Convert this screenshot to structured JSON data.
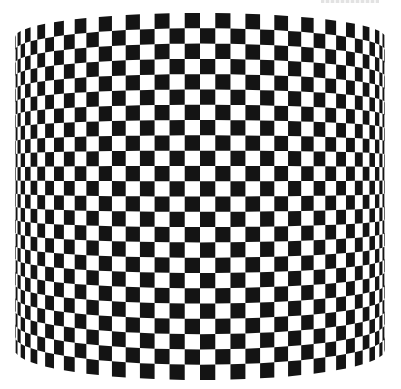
{
  "image": {
    "subject": "Black and white checkerboard pattern wrapped around a cylinder (lampshade-like shape)",
    "background_color": "#ffffff",
    "dark_color": "#141414",
    "light_color": "#ffffff",
    "pattern": {
      "type": "checkerboard",
      "visible_columns": 38,
      "rows": 24
    },
    "cropped_text_note": "Illegible cropped text fragment at top-right edge"
  }
}
